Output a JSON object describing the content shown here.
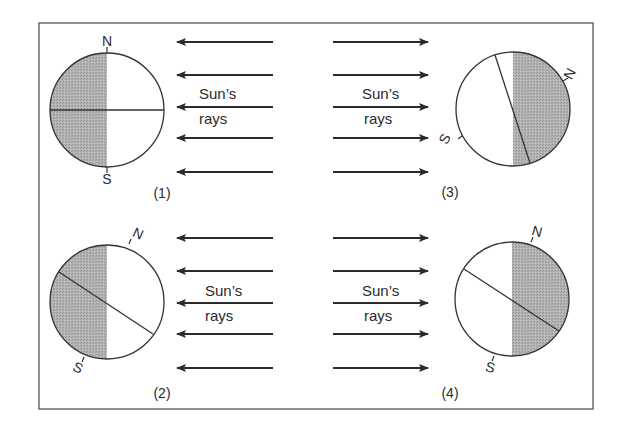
{
  "figure": {
    "colors": {
      "line": "#333333",
      "shade": "#a9a9a9",
      "frame": "#555555",
      "background": "#ffffff"
    }
  },
  "panels": [
    {
      "id": "1",
      "label": "(1)",
      "rays_label_line1": "Sun’s",
      "rays_label_line2": "rays",
      "ray_direction": "left",
      "shaded_half": "left",
      "axis_tilt": "none (vertical axis, horizontal equator line)",
      "north_label": "N",
      "south_label": "S"
    },
    {
      "id": "2",
      "label": "(2)",
      "rays_label_line1": "Sun’s",
      "rays_label_line2": "rays",
      "ray_direction": "left",
      "shaded_half": "left",
      "axis_tilt": "north pole tilted toward right (away from shaded side)",
      "north_label": "N",
      "south_label": "S"
    },
    {
      "id": "3",
      "label": "(3)",
      "rays_label_line1": "Sun’s",
      "rays_label_line2": "rays",
      "ray_direction": "right",
      "shaded_half": "right",
      "axis_tilt": "axis nearly horizontal, north pole pointing right",
      "north_label": "N",
      "south_label": "S"
    },
    {
      "id": "4",
      "label": "(4)",
      "rays_label_line1": "Sun’s",
      "rays_label_line2": "rays",
      "ray_direction": "right",
      "shaded_half": "right",
      "axis_tilt": "north pole tilted toward right (toward shaded side)",
      "north_label": "N",
      "south_label": "S"
    }
  ]
}
